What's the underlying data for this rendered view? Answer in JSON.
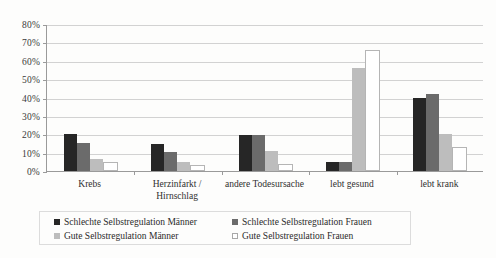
{
  "chart_data": {
    "type": "bar",
    "title": "",
    "xlabel": "",
    "ylabel": "",
    "ylim": [
      0,
      80
    ],
    "ytick_labels": [
      "0%",
      "10%",
      "20%",
      "30%",
      "40%",
      "50%",
      "60%",
      "70%",
      "80%"
    ],
    "ytick_values": [
      0,
      10,
      20,
      30,
      40,
      50,
      60,
      70,
      80
    ],
    "grid": true,
    "legend_position": "bottom",
    "categories": [
      "Krebs",
      "Herzinfarkt /\nHirnschlag",
      "andere Todesursache",
      "lebt gesund",
      "lebt krank"
    ],
    "series": [
      {
        "name": "Schlechte Selbstregulation Männer",
        "color": "#262626",
        "values": [
          20,
          14.5,
          19.5,
          5,
          40
        ]
      },
      {
        "name": "Schlechte Selbstregulation Frauen",
        "color": "#6b6b6b",
        "values": [
          15,
          10.5,
          19.5,
          5,
          42
        ]
      },
      {
        "name": "Gute Selbstregulation Männer",
        "color": "#bdbdbd",
        "values": [
          6.5,
          5,
          11,
          56,
          20
        ]
      },
      {
        "name": "Gute Selbstregulation Frauen",
        "color": "#ffffff",
        "values": [
          5,
          3.5,
          4,
          66,
          13
        ]
      }
    ]
  }
}
